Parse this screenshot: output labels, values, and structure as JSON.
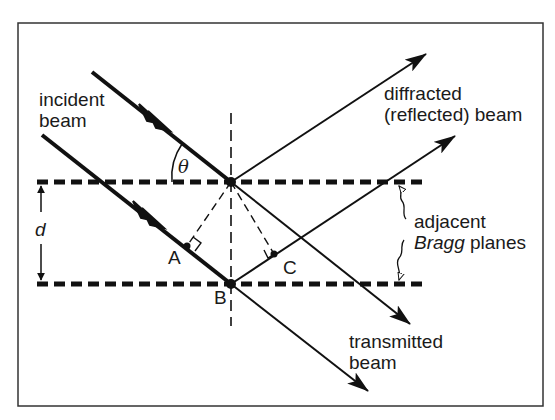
{
  "diagram": {
    "colors": {
      "ink": "#111111",
      "background": "#ffffff",
      "frame": "#333333"
    },
    "labels": {
      "incident": [
        "incident",
        "beam"
      ],
      "diffracted": [
        "diffracted",
        "(reflected) beam"
      ],
      "adjacent": "adjacent",
      "bragg": "Bragg",
      "planes": "planes",
      "transmitted": [
        "transmitted",
        "beam"
      ],
      "theta": "θ",
      "d": "d",
      "point_a": "A",
      "point_b": "B",
      "point_c": "C"
    },
    "elements": {
      "planes": [
        "upper Bragg plane (dashed)",
        "lower Bragg plane (dashed)"
      ],
      "beams": [
        "incident beam 1",
        "incident beam 2",
        "diffracted beam 1",
        "diffracted beam 2",
        "transmitted beam 1",
        "transmitted beam 2"
      ],
      "normal": "vertical dashed normal through scattering points",
      "construction": [
        "dashed perpendicular to A",
        "dashed perpendicular to C",
        "right-angle marks at A and C"
      ],
      "dimension": "spacing d between planes (double arrow)"
    }
  }
}
